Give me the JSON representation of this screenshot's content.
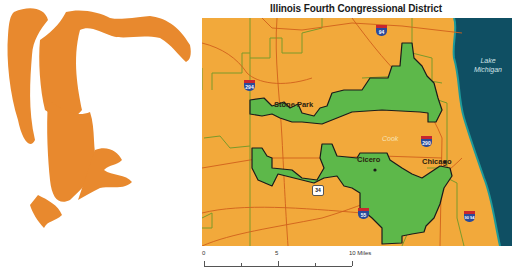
{
  "title": "Illinois Fourth Congressional District",
  "illustration": {
    "subject": "gerrymander-creature",
    "color": "#e8892e"
  },
  "colors": {
    "land": "#f2a93b",
    "district": "#5db84a",
    "district_border": "#1b1b1b",
    "lake": "#0f4f63",
    "shoreline": "#1e9a9a",
    "roads": "#d0601c",
    "boundaries": "#7a9a2a"
  },
  "map": {
    "places": [
      {
        "name": "Stone Park"
      },
      {
        "name": "Cicero"
      },
      {
        "name": "Chicago"
      }
    ],
    "county": "Cook",
    "lake": {
      "line1": "Lake",
      "line2": "Michigan"
    },
    "highways": [
      {
        "type": "interstate",
        "number": "294"
      },
      {
        "type": "interstate",
        "number": "94"
      },
      {
        "type": "interstate",
        "number": "290"
      },
      {
        "type": "interstate",
        "number": "55"
      },
      {
        "type": "interstate",
        "number": "90 94"
      },
      {
        "type": "us",
        "number": "34"
      }
    ]
  },
  "scale_bar": {
    "labels": [
      "0",
      "5",
      "10 Miles"
    ]
  }
}
